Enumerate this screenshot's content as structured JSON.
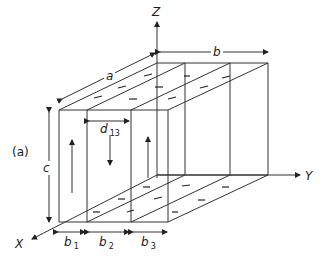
{
  "figure": {
    "panel_label": "(a)",
    "axes": {
      "x": "X",
      "y": "Y",
      "z": "Z"
    },
    "dimensions": {
      "a": "a",
      "b": "b",
      "c": "c",
      "d13": {
        "main": "d",
        "sub": "13"
      },
      "b1": {
        "main": "b",
        "sub": "1"
      },
      "b2": {
        "main": "b",
        "sub": "2"
      },
      "b3": {
        "main": "b",
        "sub": "3"
      }
    },
    "arrows_front": [
      "up",
      "down",
      "up"
    ]
  }
}
